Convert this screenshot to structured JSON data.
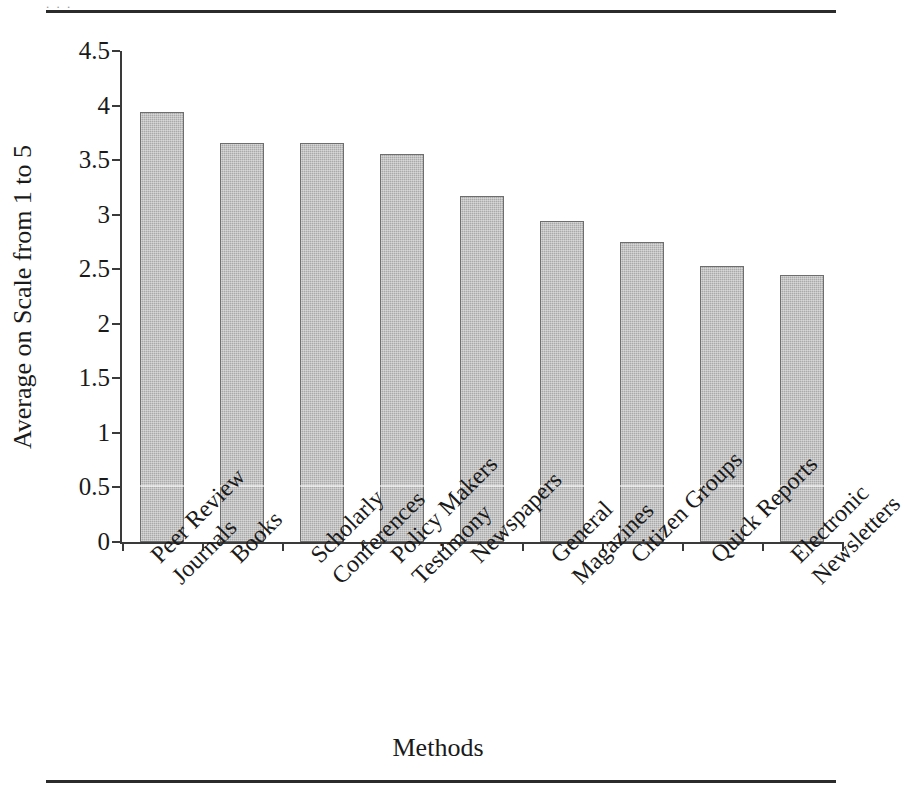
{
  "figure": {
    "caption_remnant": ". . .",
    "rules": {
      "top": true,
      "bottom": true
    }
  },
  "axes": {
    "y_title": "Average on Scale from 1 to 5",
    "x_title": "Methods",
    "y_ticks": [
      "0",
      "0.5",
      "1",
      "1.5",
      "2",
      "2.5",
      "3",
      "3.5",
      "4",
      "4.5"
    ]
  },
  "chart_data": {
    "type": "bar",
    "title": "",
    "xlabel": "Methods",
    "ylabel": "Average on Scale from 1 to 5",
    "ylim": [
      0,
      4.5
    ],
    "ytick_step": 0.5,
    "grid": false,
    "legend": "none",
    "bar_color": "#a9a9a9",
    "bar_edge_color": "#6e6e6e",
    "categories": [
      "Peer Review Journals",
      "Books",
      "Scholarly Conferences",
      "Policy Makers Testimony",
      "Newspapers",
      "General Magazines",
      "Citizen Groups",
      "Quick Reports",
      "Electronic Newsletters"
    ],
    "category_lines": [
      [
        "Peer Review",
        "Journals"
      ],
      [
        "Books",
        ""
      ],
      [
        "Scholarly",
        "Conferences"
      ],
      [
        "Policy Makers",
        "Testimony"
      ],
      [
        "Newspapers",
        ""
      ],
      [
        "General",
        "Magazines"
      ],
      [
        "Citizen Groups",
        ""
      ],
      [
        "Quick Reports",
        ""
      ],
      [
        "Electronic",
        "Newsletters"
      ]
    ],
    "values": [
      3.94,
      3.66,
      3.66,
      3.56,
      3.17,
      2.94,
      2.75,
      2.53,
      2.45
    ]
  }
}
